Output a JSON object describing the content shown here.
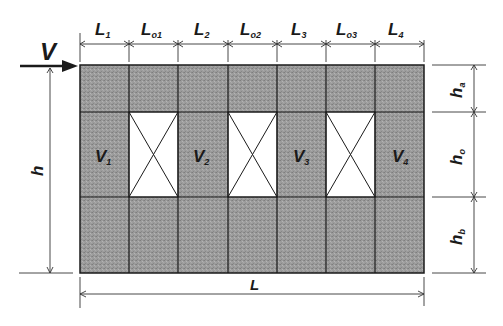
{
  "diagram": {
    "load": {
      "symbol": "V",
      "label": "V"
    },
    "top_dimensions": [
      {
        "main": "L",
        "sub": "1"
      },
      {
        "main": "L",
        "sub": "o1"
      },
      {
        "main": "L",
        "sub": "2"
      },
      {
        "main": "L",
        "sub": "o2"
      },
      {
        "main": "L",
        "sub": "3"
      },
      {
        "main": "L",
        "sub": "o3"
      },
      {
        "main": "L",
        "sub": "4"
      }
    ],
    "right_dimensions": [
      {
        "main": "h",
        "sub": "a"
      },
      {
        "main": "h",
        "sub": "o"
      },
      {
        "main": "h",
        "sub": "b"
      }
    ],
    "height_dimension": {
      "main": "h",
      "sub": ""
    },
    "length_dimension": {
      "main": "L",
      "sub": ""
    },
    "piers": [
      {
        "main": "V",
        "sub": "1"
      },
      {
        "main": "V",
        "sub": "2"
      },
      {
        "main": "V",
        "sub": "3"
      },
      {
        "main": "V",
        "sub": "4"
      }
    ],
    "openings": [
      "opening-1",
      "opening-2",
      "opening-3"
    ],
    "colors": {
      "wall_fill": "#9a9a9a",
      "opening_fill": "#ffffff",
      "line": "#1a1a1a"
    }
  }
}
